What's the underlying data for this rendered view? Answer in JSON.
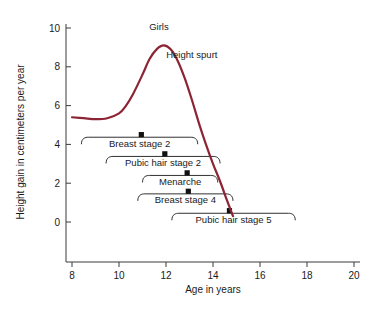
{
  "chart_data": {
    "type": "line",
    "title": "",
    "xlabel": "Age in years",
    "ylabel": "Height gain in centimeters per year",
    "xlim": [
      8,
      20
    ],
    "ylim": [
      0,
      10
    ],
    "xticks": [
      8,
      10,
      12,
      14,
      16,
      18,
      20
    ],
    "xtick_labels": [
      "8",
      "10",
      "12",
      "14",
      "16",
      "18",
      "20"
    ],
    "yticks": [
      0,
      2,
      4,
      6,
      8,
      10
    ],
    "ytick_labels": [
      "0",
      "2",
      "4",
      "6",
      "8",
      "10"
    ],
    "grid": false,
    "legend": "none",
    "series": [
      {
        "name": "Girls",
        "color": "#8d2433",
        "x": [
          8.0,
          8.5,
          9.0,
          9.5,
          10.0,
          10.3,
          10.6,
          11.0,
          11.3,
          11.6,
          11.9,
          12.2,
          12.5,
          12.8,
          13.1,
          13.4,
          13.7,
          14.0,
          14.3,
          14.6,
          14.85
        ],
        "y": [
          5.4,
          5.35,
          5.3,
          5.35,
          5.6,
          6.0,
          6.6,
          7.6,
          8.4,
          8.9,
          9.1,
          8.9,
          8.3,
          7.4,
          6.3,
          5.1,
          4.0,
          3.0,
          2.1,
          1.1,
          0.3
        ]
      }
    ],
    "annotations": [
      {
        "text": "Girls",
        "x": 11.7,
        "y": 9.9,
        "name": "girls-curve-label"
      },
      {
        "text": "Height spurt",
        "x": 13.1,
        "y": 8.45,
        "name": "height-spurt-label"
      }
    ],
    "event_bars": [
      {
        "label": "Breast stage 2",
        "start_age": 8.4,
        "end_age": 13.35,
        "median_age": 10.95,
        "row_y": 4.37
      },
      {
        "label": "Pubic hair stage 2",
        "start_age": 9.45,
        "end_age": 14.3,
        "median_age": 11.95,
        "row_y": 3.38
      },
      {
        "label": "Menarche",
        "start_age": 11.0,
        "end_age": 14.2,
        "median_age": 12.9,
        "row_y": 2.4
      },
      {
        "label": "Breast stage 4",
        "start_age": 10.8,
        "end_age": 14.85,
        "median_age": 12.95,
        "row_y": 1.45
      },
      {
        "label": "Pubic hair stage 5",
        "start_age": 12.25,
        "end_age": 17.5,
        "median_age": 14.7,
        "row_y": 0.45
      }
    ]
  },
  "colors": {
    "curve": "#8d2433",
    "axis": "#3a3a3a",
    "text": "#1a1a1a",
    "background": "#ffffff"
  }
}
